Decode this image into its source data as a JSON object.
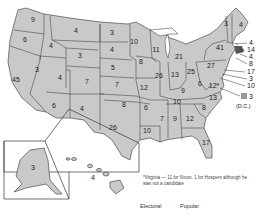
{
  "map": {
    "title": "Electoral vote by state",
    "fill_color": "#c9c9c9",
    "border_color": "#333333",
    "states": [
      {
        "abbr": "WA",
        "votes": "9",
        "x": 33,
        "y": 22
      },
      {
        "abbr": "OR",
        "votes": "6",
        "x": 25,
        "y": 42
      },
      {
        "abbr": "CA",
        "votes": "45",
        "x": 16,
        "y": 82
      },
      {
        "abbr": "ID",
        "votes": "4",
        "x": 51,
        "y": 48
      },
      {
        "abbr": "NV",
        "votes": "3",
        "x": 37,
        "y": 72
      },
      {
        "abbr": "MT",
        "votes": "4",
        "x": 76,
        "y": 33
      },
      {
        "abbr": "WY",
        "votes": "3",
        "x": 80,
        "y": 58
      },
      {
        "abbr": "UT",
        "votes": "4",
        "x": 60,
        "y": 80
      },
      {
        "abbr": "CO",
        "votes": "7",
        "x": 87,
        "y": 84
      },
      {
        "abbr": "AZ",
        "votes": "6",
        "x": 54,
        "y": 108
      },
      {
        "abbr": "NM",
        "votes": "4",
        "x": 82,
        "y": 111
      },
      {
        "abbr": "ND",
        "votes": "3",
        "x": 112,
        "y": 35
      },
      {
        "abbr": "SD",
        "votes": "4",
        "x": 112,
        "y": 52
      },
      {
        "abbr": "NE",
        "votes": "5",
        "x": 113,
        "y": 70
      },
      {
        "abbr": "KS",
        "votes": "7",
        "x": 117,
        "y": 87
      },
      {
        "abbr": "OK",
        "votes": "8",
        "x": 124,
        "y": 107
      },
      {
        "abbr": "TX",
        "votes": "26",
        "x": 113,
        "y": 130
      },
      {
        "abbr": "MN",
        "votes": "10",
        "x": 134,
        "y": 44
      },
      {
        "abbr": "IA",
        "votes": "8",
        "x": 141,
        "y": 64
      },
      {
        "abbr": "MO",
        "votes": "12",
        "x": 144,
        "y": 90
      },
      {
        "abbr": "AR",
        "votes": "6",
        "x": 146,
        "y": 110
      },
      {
        "abbr": "LA",
        "votes": "10",
        "x": 147,
        "y": 133
      },
      {
        "abbr": "WI",
        "votes": "11",
        "x": 156,
        "y": 52
      },
      {
        "abbr": "IL",
        "votes": "26",
        "x": 159,
        "y": 78
      },
      {
        "abbr": "MI",
        "votes": "21",
        "x": 179,
        "y": 59
      },
      {
        "abbr": "IN",
        "votes": "13",
        "x": 175,
        "y": 77
      },
      {
        "abbr": "OH",
        "votes": "25",
        "x": 191,
        "y": 74
      },
      {
        "abbr": "KY",
        "votes": "9",
        "x": 183,
        "y": 93
      },
      {
        "abbr": "TN",
        "votes": "10",
        "x": 177,
        "y": 104
      },
      {
        "abbr": "MS",
        "votes": "7",
        "x": 162,
        "y": 121
      },
      {
        "abbr": "AL",
        "votes": "9",
        "x": 175,
        "y": 121
      },
      {
        "abbr": "GA",
        "votes": "12",
        "x": 190,
        "y": 121
      },
      {
        "abbr": "FL",
        "votes": "17",
        "x": 206,
        "y": 145
      },
      {
        "abbr": "SC",
        "votes": "8",
        "x": 204,
        "y": 110
      },
      {
        "abbr": "NC",
        "votes": "13",
        "x": 213,
        "y": 100
      },
      {
        "abbr": "VA",
        "votes": "12*",
        "x": 214,
        "y": 88
      },
      {
        "abbr": "WV",
        "votes": "6",
        "x": 200,
        "y": 86
      },
      {
        "abbr": "PA",
        "votes": "27",
        "x": 211,
        "y": 68
      },
      {
        "abbr": "NY",
        "votes": "41",
        "x": 220,
        "y": 50
      },
      {
        "abbr": "VT",
        "votes": "3",
        "x": 226,
        "y": 26
      },
      {
        "abbr": "ME",
        "votes": "4",
        "x": 241,
        "y": 27
      }
    ],
    "callouts": [
      {
        "abbr": "NH",
        "votes": "4",
        "x": 249,
        "y": 45
      },
      {
        "abbr": "MA",
        "votes": "14",
        "x": 247,
        "y": 52
      },
      {
        "abbr": "RI",
        "votes": "4",
        "x": 249,
        "y": 59
      },
      {
        "abbr": "CT",
        "votes": "8",
        "x": 249,
        "y": 66
      },
      {
        "abbr": "NJ",
        "votes": "17",
        "x": 247,
        "y": 74
      },
      {
        "abbr": "DE",
        "votes": "3",
        "x": 249,
        "y": 81
      },
      {
        "abbr": "MD",
        "votes": "10",
        "x": 247,
        "y": 88
      }
    ],
    "dc": {
      "votes": "3",
      "label": "(D.C.)"
    },
    "insets": {
      "alaska": {
        "abbr": "AK",
        "votes": "3"
      },
      "hawaii": {
        "abbr": "HI",
        "votes": "4"
      }
    }
  },
  "footnote": "*Virginia — 11 for Nixon, 1 for Hospers although he was not a candidate",
  "table_header": {
    "electoral": "Electoral",
    "popular": "Popular"
  }
}
